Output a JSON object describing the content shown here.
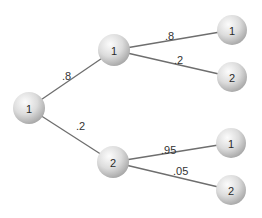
{
  "diagram": {
    "type": "probability-tree",
    "nodes": [
      {
        "id": "root",
        "label": "1",
        "x": 29,
        "y": 108,
        "r": 16
      },
      {
        "id": "mid1",
        "label": "1",
        "x": 114,
        "y": 50,
        "r": 16
      },
      {
        "id": "mid2",
        "label": "2",
        "x": 113,
        "y": 162,
        "r": 16
      },
      {
        "id": "leaf11",
        "label": "1",
        "x": 232,
        "y": 30,
        "r": 15
      },
      {
        "id": "leaf12",
        "label": "2",
        "x": 232,
        "y": 77,
        "r": 15
      },
      {
        "id": "leaf21",
        "label": "1",
        "x": 231,
        "y": 143,
        "r": 15
      },
      {
        "id": "leaf22",
        "label": "2",
        "x": 231,
        "y": 190,
        "r": 15
      }
    ],
    "edges": [
      {
        "from": "root",
        "to": "mid1",
        "label": ".8",
        "lx": 62,
        "ly": 80
      },
      {
        "from": "root",
        "to": "mid2",
        "label": ".2",
        "lx": 76,
        "ly": 130
      },
      {
        "from": "mid1",
        "to": "leaf11",
        "label": ".8",
        "lx": 165,
        "ly": 40
      },
      {
        "from": "mid1",
        "to": "leaf12",
        "label": ".2",
        "lx": 174,
        "ly": 64
      },
      {
        "from": "mid2",
        "to": "leaf21",
        "label": ".95",
        "lx": 161,
        "ly": 154
      },
      {
        "from": "mid2",
        "to": "leaf22",
        "label": ".05",
        "lx": 173,
        "ly": 175
      }
    ]
  },
  "colors": {
    "edge": "#6e6e6e",
    "node_light": "#fafafa",
    "node_dark": "#b4b4b4",
    "text": "#2a2a2a"
  }
}
